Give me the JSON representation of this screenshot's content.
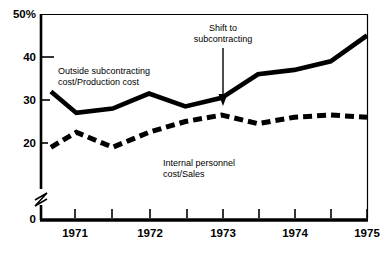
{
  "chart_data": {
    "type": "line",
    "title": "",
    "subtitle": "",
    "xlabel": "",
    "ylabel": "",
    "ylim": [
      0,
      50
    ],
    "xlim": [
      1970.5,
      1975.0
    ],
    "grid": false,
    "legend_position": "inline-labels",
    "y_axis": {
      "tick_labels": [
        "50%",
        "40",
        "30",
        "20",
        "0"
      ],
      "tick_values": [
        50,
        40,
        30,
        20,
        0
      ],
      "axis_break": true,
      "axis_break_note": "zigzag break between 0 and 20"
    },
    "x_axis": {
      "tick_labels": [
        "1971",
        "1972",
        "1973",
        "1974",
        "1975"
      ],
      "tick_values": [
        1971,
        1972,
        1973,
        1974,
        1975
      ],
      "minor_ticks": [
        1970.5,
        1971.5,
        1972.5,
        1973.5,
        1974.5
      ]
    },
    "x": [
      1970.65,
      1971.0,
      1971.5,
      1972.0,
      1972.5,
      1973.0,
      1973.5,
      1974.0,
      1974.5,
      1975.0
    ],
    "series": [
      {
        "name": "Outside subcontracting cost/Production cost",
        "style": "solid",
        "color": "#000000",
        "values": [
          32.0,
          27.0,
          28.0,
          31.5,
          28.5,
          30.5,
          36.0,
          37.0,
          39.0,
          45.0
        ]
      },
      {
        "name": "Internal personnel cost/Sales",
        "style": "dashed",
        "color": "#000000",
        "values": [
          19.0,
          22.5,
          19.0,
          22.5,
          25.0,
          26.5,
          24.5,
          26.0,
          26.5,
          26.0
        ]
      }
    ],
    "series_labels": [
      {
        "name": "solid-series-label",
        "line1": "Outside subcontracting",
        "line2": "cost/Production cost"
      },
      {
        "name": "dashed-series-label",
        "line1": "Internal personnel",
        "line2": "cost/Sales"
      }
    ],
    "annotations": [
      {
        "name": "shift-to-subcontracting-annotation",
        "line1": "Shift to",
        "line2": "subcontracting",
        "arrow": "down",
        "points_at_x": 1973.0,
        "points_at_y": 30.5
      }
    ],
    "colors": {
      "background": "#ffffff",
      "foreground": "#000000"
    }
  }
}
